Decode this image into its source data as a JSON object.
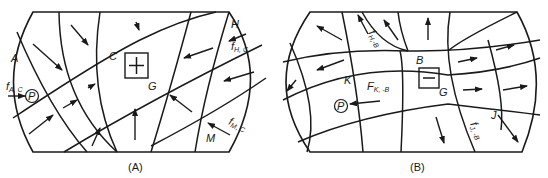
{
  "panels": [
    {
      "id": "A",
      "caption": "(A)",
      "region_labels": {
        "A": "A",
        "C": "C",
        "H": "H",
        "M": "M",
        "G": "G"
      },
      "point_label": "P",
      "forces": [
        {
          "main": "f",
          "sub": "A, C"
        },
        {
          "main": "f",
          "sub": "H, C"
        },
        {
          "main": "f",
          "sub": "M, C"
        }
      ],
      "center_symbol": "plus"
    },
    {
      "id": "B",
      "caption": "(B)",
      "region_labels": {
        "B": "B",
        "K": "K",
        "J": "J",
        "G": "G"
      },
      "point_label": "P",
      "forces": [
        {
          "main": "f",
          "sub": "H,-B"
        },
        {
          "main": "F",
          "sub": "K, -B"
        },
        {
          "main": "f",
          "sub": "J, -B"
        }
      ],
      "center_symbol": "minus"
    }
  ],
  "colors": {
    "ink": "#1a1a1a",
    "background": "#ffffff"
  }
}
